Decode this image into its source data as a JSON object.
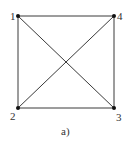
{
  "diagram": {
    "caption": "a)",
    "nodes": [
      {
        "id": "1",
        "label": "1",
        "x": 18,
        "y": 16
      },
      {
        "id": "2",
        "label": "2",
        "x": 18,
        "y": 108
      },
      {
        "id": "3",
        "label": "3",
        "x": 114,
        "y": 108
      },
      {
        "id": "4",
        "label": "4",
        "x": 114,
        "y": 16
      }
    ],
    "edges": [
      [
        "1",
        "4"
      ],
      [
        "1",
        "2"
      ],
      [
        "2",
        "3"
      ],
      [
        "4",
        "3"
      ],
      [
        "1",
        "3"
      ],
      [
        "2",
        "4"
      ]
    ],
    "colors": {
      "line": "#3a3a3a",
      "node": "#111111",
      "text": "#333333"
    }
  }
}
